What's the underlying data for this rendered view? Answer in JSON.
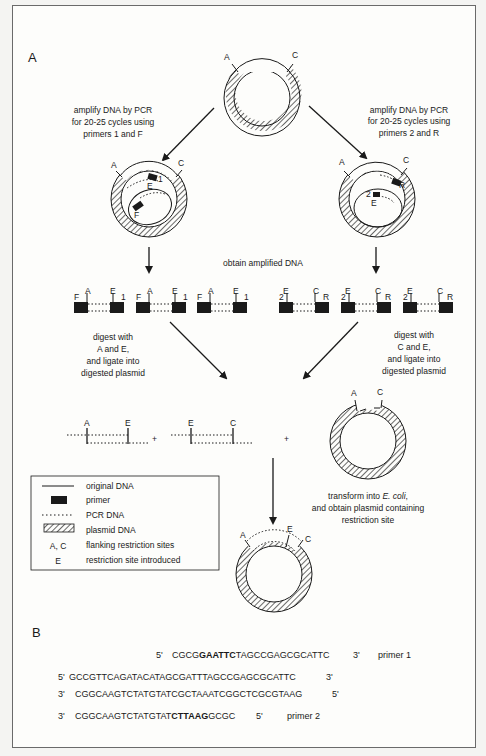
{
  "panel_a": {
    "label": "A",
    "top_plasmid": {
      "site_left": "A",
      "site_right": "C"
    },
    "step_left": [
      "amplify DNA by PCR",
      "for 20-25 cycles using",
      "primers 1 and F"
    ],
    "step_right": [
      "amplify DNA by PCR",
      "for 20-25 cycles using",
      "primers 2 and R"
    ],
    "left_pcr_circle": {
      "site_left": "A",
      "site_right": "C",
      "site_mid": "E",
      "primer_a": "1",
      "primer_b": "F"
    },
    "right_pcr_circle": {
      "site_left": "A",
      "site_right": "C",
      "site_mid": "E",
      "primer_a": "2",
      "primer_b": "R"
    },
    "obtain_label": "obtain amplified DNA",
    "left_fragments": {
      "primer_left": "F",
      "site_left": "A",
      "site_right": "E",
      "primer_right": "1",
      "count": 3
    },
    "right_fragments": {
      "primer_left": "2",
      "site_left": "E",
      "site_right": "C",
      "primer_right": "R",
      "count": 3
    },
    "digest_left": [
      "digest with",
      "A and E,",
      "and ligate into",
      "digested plasmid"
    ],
    "digest_right": [
      "digest with",
      "C and E,",
      "and ligate into",
      "digested plasmid"
    ],
    "ligation": {
      "frag1_left": "A",
      "frag1_right": "E",
      "plus1": "+",
      "frag2_left": "E",
      "frag2_right": "C",
      "plus2": "+",
      "plasmid_left": "A",
      "plasmid_right": "C"
    },
    "transform_label": [
      "transform into E. coli,",
      "and obtain plasmid containing",
      "restriction site"
    ],
    "transform_italic": "E. coli",
    "final_plasmid": {
      "site_left": "A",
      "site_mid": "E",
      "site_right": "C"
    },
    "legend": [
      {
        "symbol": "line",
        "label": "original DNA"
      },
      {
        "symbol": "box",
        "label": "primer"
      },
      {
        "symbol": "dots",
        "label": "PCR DNA"
      },
      {
        "symbol": "hatch",
        "label": "plasmid DNA"
      },
      {
        "symbol": "A, C",
        "label": "flanking restriction sites"
      },
      {
        "symbol": "E",
        "label": "restriction site introduced"
      }
    ]
  },
  "panel_b": {
    "label": "B",
    "primer1": {
      "left": "5'",
      "pre": "CGCG",
      "bold": "GAATTC",
      "post": "TAGCCGAGCGCATTC",
      "right": "3'",
      "name": "primer 1"
    },
    "top_strand": {
      "left": "5'",
      "seq": "GCCGTTCAGATACATAGCGATTTAGCCGAGCGCATTC",
      "right": "3'"
    },
    "bottom_strand": {
      "left": "3'",
      "seq": "CGGCAAGTCTATGTATCGCTAAATCGGCTCGCGTAAG",
      "right": "5'"
    },
    "primer2": {
      "left": "3'",
      "pre": "CGGCAAGTCTATGTAT",
      "bold": "CTTAAG",
      "post": "GCGC",
      "right": "5'",
      "name": "primer 2"
    }
  },
  "colors": {
    "ink": "#1a1a1a",
    "frame": "#6a6a6a",
    "paper": "#fdfdfb"
  }
}
